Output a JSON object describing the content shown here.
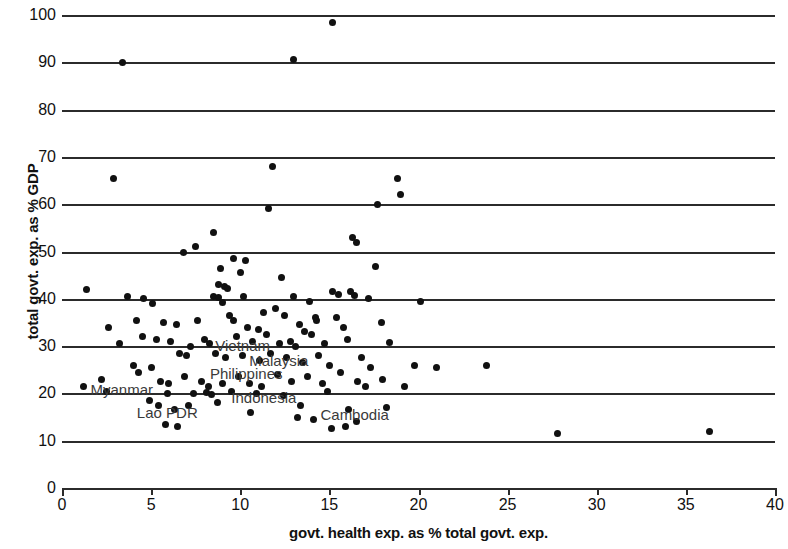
{
  "chart_data": {
    "type": "scatter",
    "title": "",
    "xlabel": "govt. health exp. as % total govt. exp.",
    "ylabel": "total govt. exp. as % GDP",
    "xlim": [
      0,
      40
    ],
    "ylim": [
      0,
      100
    ],
    "xticks": [
      0,
      5,
      10,
      15,
      20,
      25,
      30,
      35,
      40
    ],
    "yticks": [
      0,
      10,
      20,
      30,
      40,
      50,
      60,
      70,
      80,
      90,
      100
    ],
    "grid": "horizontal",
    "legend": "none",
    "marker_color": "#111111",
    "points": [
      [
        15.2,
        98.5
      ],
      [
        3.4,
        90.0
      ],
      [
        13.0,
        90.5
      ],
      [
        2.9,
        65.5
      ],
      [
        11.8,
        68.0
      ],
      [
        18.8,
        65.5
      ],
      [
        19.0,
        62.0
      ],
      [
        17.7,
        60.0
      ],
      [
        11.6,
        59.0
      ],
      [
        16.3,
        53.0
      ],
      [
        16.5,
        52.0
      ],
      [
        8.5,
        54.0
      ],
      [
        7.5,
        51.0
      ],
      [
        6.8,
        49.8
      ],
      [
        17.6,
        46.8
      ],
      [
        9.6,
        48.5
      ],
      [
        10.3,
        48.0
      ],
      [
        8.9,
        46.5
      ],
      [
        10.0,
        45.5
      ],
      [
        12.3,
        44.5
      ],
      [
        8.8,
        43.0
      ],
      [
        9.1,
        42.5
      ],
      [
        9.3,
        42.2
      ],
      [
        1.4,
        42.0
      ],
      [
        3.7,
        40.5
      ],
      [
        4.6,
        40.0
      ],
      [
        5.1,
        39.0
      ],
      [
        8.5,
        40.5
      ],
      [
        8.8,
        40.2
      ],
      [
        9.0,
        39.2
      ],
      [
        10.2,
        40.5
      ],
      [
        13.0,
        40.5
      ],
      [
        13.9,
        39.5
      ],
      [
        15.2,
        41.5
      ],
      [
        15.5,
        41.0
      ],
      [
        16.2,
        41.5
      ],
      [
        16.4,
        40.8
      ],
      [
        17.2,
        40.0
      ],
      [
        20.1,
        39.5
      ],
      [
        12.0,
        38.0
      ],
      [
        11.3,
        37.0
      ],
      [
        12.5,
        36.5
      ],
      [
        14.2,
        36.0
      ],
      [
        4.2,
        35.5
      ],
      [
        5.7,
        35.0
      ],
      [
        6.4,
        34.5
      ],
      [
        2.6,
        34.0
      ],
      [
        7.6,
        35.5
      ],
      [
        9.4,
        36.5
      ],
      [
        9.6,
        35.5
      ],
      [
        10.4,
        34.0
      ],
      [
        11.0,
        33.5
      ],
      [
        13.3,
        34.5
      ],
      [
        13.6,
        33.0
      ],
      [
        14.0,
        32.5
      ],
      [
        14.3,
        35.5
      ],
      [
        15.4,
        36.0
      ],
      [
        15.8,
        34.0
      ],
      [
        17.9,
        35.0
      ],
      [
        4.5,
        32.0
      ],
      [
        5.3,
        31.5
      ],
      [
        6.1,
        31.0
      ],
      [
        3.2,
        30.5
      ],
      [
        7.2,
        30.0
      ],
      [
        8.0,
        31.5
      ],
      [
        8.3,
        30.5
      ],
      [
        9.8,
        32.0
      ],
      [
        10.7,
        31.0
      ],
      [
        11.5,
        32.5
      ],
      [
        12.2,
        30.5
      ],
      [
        12.8,
        31.0
      ],
      [
        13.1,
        30.0
      ],
      [
        14.7,
        30.5
      ],
      [
        16.0,
        31.5
      ],
      [
        18.4,
        30.8
      ],
      [
        6.6,
        28.5
      ],
      [
        7.0,
        28.0
      ],
      [
        8.6,
        28.5
      ],
      [
        9.2,
        27.5
      ],
      [
        10.1,
        28.0
      ],
      [
        11.1,
        27.0
      ],
      [
        11.7,
        28.5
      ],
      [
        12.6,
        27.5
      ],
      [
        13.5,
        26.5
      ],
      [
        14.4,
        28.0
      ],
      [
        15.0,
        26.0
      ],
      [
        16.8,
        27.5
      ],
      [
        17.3,
        25.5
      ],
      [
        19.8,
        26.0
      ],
      [
        21.0,
        25.5
      ],
      [
        23.8,
        26.0
      ],
      [
        1.2,
        21.5
      ],
      [
        2.2,
        23.0
      ],
      [
        2.5,
        20.5
      ],
      [
        4.0,
        26.0
      ],
      [
        4.3,
        24.5
      ],
      [
        5.0,
        25.5
      ],
      [
        5.5,
        22.5
      ],
      [
        6.0,
        22.0
      ],
      [
        6.9,
        23.5
      ],
      [
        7.8,
        22.5
      ],
      [
        8.2,
        21.5
      ],
      [
        9.0,
        22.0
      ],
      [
        9.9,
        23.5
      ],
      [
        10.5,
        22.0
      ],
      [
        11.2,
        21.5
      ],
      [
        12.1,
        24.0
      ],
      [
        12.9,
        22.5
      ],
      [
        13.8,
        23.5
      ],
      [
        14.6,
        22.0
      ],
      [
        15.6,
        24.5
      ],
      [
        16.6,
        22.5
      ],
      [
        17.0,
        21.5
      ],
      [
        18.0,
        23.0
      ],
      [
        19.2,
        21.5
      ],
      [
        5.9,
        20.0
      ],
      [
        7.4,
        20.0
      ],
      [
        8.1,
        20.2
      ],
      [
        8.4,
        19.8
      ],
      [
        9.5,
        20.5
      ],
      [
        10.9,
        20.0
      ],
      [
        12.4,
        19.5
      ],
      [
        14.9,
        20.5
      ],
      [
        4.9,
        18.5
      ],
      [
        5.4,
        17.5
      ],
      [
        6.3,
        16.5
      ],
      [
        7.1,
        17.5
      ],
      [
        10.6,
        16.0
      ],
      [
        13.2,
        15.0
      ],
      [
        14.1,
        14.5
      ],
      [
        16.5,
        14.0
      ],
      [
        5.8,
        13.5
      ],
      [
        6.5,
        13.0
      ],
      [
        15.1,
        12.5
      ],
      [
        16.1,
        16.5
      ],
      [
        15.9,
        13.0
      ],
      [
        27.8,
        11.5
      ],
      [
        36.3,
        12.0
      ],
      [
        13.4,
        17.5
      ],
      [
        18.2,
        17.0
      ],
      [
        8.7,
        18.0
      ]
    ],
    "annotations": [
      {
        "label": "Vietnam",
        "x": 8.6,
        "y": 30.0
      },
      {
        "label": "Malaysia",
        "x": 10.5,
        "y": 26.8
      },
      {
        "label": "Philippines",
        "x": 8.3,
        "y": 24.0
      },
      {
        "label": "Myanmar",
        "x": 1.6,
        "y": 20.8
      },
      {
        "label": "Indonesia",
        "x": 9.5,
        "y": 19.0
      },
      {
        "label": "Lao PDR",
        "x": 4.2,
        "y": 15.8
      },
      {
        "label": "Cambodia",
        "x": 14.5,
        "y": 15.5
      }
    ]
  }
}
